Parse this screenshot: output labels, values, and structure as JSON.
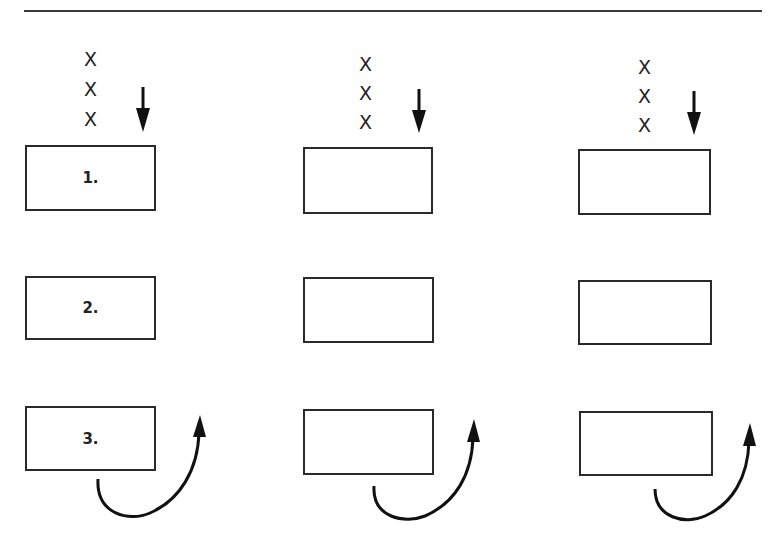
{
  "diagram": {
    "columns": [
      {
        "marks": [
          "X",
          "X",
          "X"
        ],
        "boxes": [
          {
            "label": "1."
          },
          {
            "label": "2."
          },
          {
            "label": "3."
          }
        ]
      },
      {
        "marks": [
          "X",
          "X",
          "X"
        ],
        "boxes": [
          {
            "label": ""
          },
          {
            "label": ""
          },
          {
            "label": ""
          }
        ]
      },
      {
        "marks": [
          "X",
          "X",
          "X"
        ],
        "boxes": [
          {
            "label": ""
          },
          {
            "label": ""
          },
          {
            "label": ""
          }
        ]
      }
    ],
    "icons": {
      "down_arrow": "down-arrow-icon",
      "curved_arrow": "curved-up-arrow-icon"
    },
    "colors": {
      "stroke": "#1a1a1a",
      "background": "#ffffff"
    }
  }
}
